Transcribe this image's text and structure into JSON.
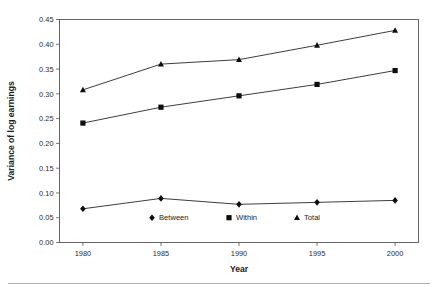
{
  "chart_data": {
    "type": "line",
    "title": "",
    "xlabel": "Year",
    "ylabel": "Variance of log earnings",
    "x": [
      1980,
      1985,
      1990,
      1995,
      2000
    ],
    "xtick_labels": [
      "1980",
      "1985",
      "1990",
      "1995",
      "2000"
    ],
    "xlim": [
      1978.5,
      2001.5
    ],
    "ylim": [
      0.0,
      0.45
    ],
    "ytick_labels": [
      "0.00",
      "0.05",
      "0.10",
      "0.15",
      "0.20",
      "0.25",
      "0.30",
      "0.35",
      "0.40",
      "0.45"
    ],
    "ytick_values": [
      0.0,
      0.05,
      0.1,
      0.15,
      0.2,
      0.25,
      0.3,
      0.35,
      0.4,
      0.45
    ],
    "grid": false,
    "legend_position": "inside-bottom-center",
    "series": [
      {
        "name": "Between",
        "marker": "diamond",
        "color": "#0d0d0d",
        "values": [
          0.068,
          0.089,
          0.077,
          0.081,
          0.085
        ]
      },
      {
        "name": "Within",
        "marker": "square",
        "color": "#0d0d0d",
        "values": [
          0.241,
          0.273,
          0.296,
          0.319,
          0.347
        ]
      },
      {
        "name": "Total",
        "marker": "triangle",
        "color": "#0d0d0d",
        "values": [
          0.308,
          0.36,
          0.369,
          0.398,
          0.428
        ]
      }
    ]
  },
  "axes": {
    "x_title": "Year",
    "y_title": "Variance of log earnings"
  },
  "legend": {
    "items": [
      {
        "label": "Between",
        "marker": "diamond"
      },
      {
        "label": "Within",
        "marker": "square"
      },
      {
        "label": "Total",
        "marker": "triangle"
      }
    ]
  }
}
